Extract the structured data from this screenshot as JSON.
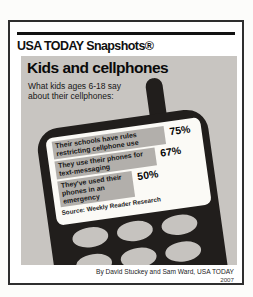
{
  "brand": {
    "title": "USA TODAY Snapshots®"
  },
  "infographic": {
    "title": "Kids and cellphones",
    "subtitle": "What kids ages 6-18 say about their cellphones:",
    "source": "Source: Weekly Reader Research"
  },
  "chart_data": {
    "type": "bar",
    "orientation": "horizontal",
    "title": "Kids and cellphones",
    "subtitle": "What kids ages 6-18 say about their cellphones:",
    "categories": [
      "Their schools have rules restricting cellphone use",
      "They use their phones for text-messaging",
      "They've used their phones in an emergency"
    ],
    "values": [
      75,
      67,
      50
    ],
    "value_labels": [
      "75%",
      "67%",
      "50%"
    ],
    "unit": "%",
    "xlim": [
      0,
      100
    ],
    "source": "Source: Weekly Reader Research",
    "legend": "none",
    "grid": "off"
  },
  "credit": {
    "byline": "By David Stuckey and Sam Ward, USA TODAY",
    "year": "2007"
  },
  "colors": {
    "frame-border": "#2e2e2e",
    "rule": "#111111",
    "panel-bg": "#c8c5c1",
    "phone": "#211e1c",
    "screen": "#fbfaf6",
    "bar": "#b2afab",
    "key": "#c6c3bf"
  }
}
